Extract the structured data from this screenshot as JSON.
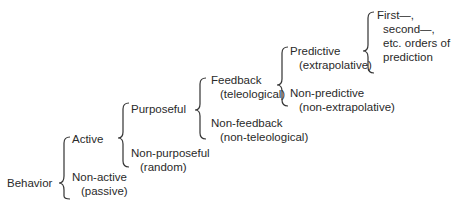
{
  "diagram": {
    "type": "classification-tree",
    "root": "Behavior",
    "levels": [
      {
        "upper": {
          "label": "Active"
        },
        "lower": {
          "label": "Non-active",
          "sub": "(passive)"
        }
      },
      {
        "upper": {
          "label": "Purposeful"
        },
        "lower": {
          "label": "Non-purposeful",
          "sub": "(random)"
        }
      },
      {
        "upper": {
          "label": "Feedback",
          "sub": "(teleological)"
        },
        "lower": {
          "label": "Non-feedback",
          "sub": "(non-teleological)"
        }
      },
      {
        "upper": {
          "label": "Predictive",
          "sub": "(extrapolative)"
        },
        "lower": {
          "label": "Non-predictive",
          "sub": "(non-extrapolative)"
        }
      },
      {
        "upper": {
          "lines": [
            "First—,",
            "second—,",
            "etc. orders of",
            "prediction"
          ]
        }
      }
    ]
  }
}
